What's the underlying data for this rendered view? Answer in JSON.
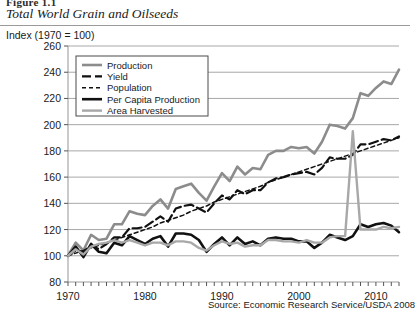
{
  "figure": {
    "label": "Figure 1.1",
    "title": "Total World Grain and Oilseeds",
    "axis_caption": "Index (1970 = 100)",
    "source": "Source: Economic Research Service/USDA 2008"
  },
  "chart_data": {
    "type": "line",
    "title": "Total World Grain and Oilseeds",
    "subtitle": "Index (1970 = 100)",
    "xlabel": "",
    "ylabel": "Index (1970 = 100)",
    "xlim": [
      1970,
      2013
    ],
    "ylim": [
      80,
      260
    ],
    "yticks": [
      80,
      100,
      120,
      140,
      160,
      180,
      200,
      220,
      240,
      260
    ],
    "xticks": [
      1970,
      1980,
      1990,
      2000,
      2010
    ],
    "xtick_labels": [
      "1970",
      "1980",
      "1990",
      "2000",
      "2010"
    ],
    "minor_xtick_interval": 1,
    "grid": "horizontal",
    "legend_position": "upper-left-inside",
    "annotation": "Area Harvested shows a single-year spike near 2007",
    "x": [
      1970,
      1971,
      1972,
      1973,
      1974,
      1975,
      1976,
      1977,
      1978,
      1979,
      1980,
      1981,
      1982,
      1983,
      1984,
      1985,
      1986,
      1987,
      1988,
      1989,
      1990,
      1991,
      1992,
      1993,
      1994,
      1995,
      1996,
      1997,
      1998,
      1999,
      2000,
      2001,
      2002,
      2003,
      2004,
      2005,
      2006,
      2007,
      2008,
      2009,
      2010,
      2011,
      2012,
      2013
    ],
    "series": [
      {
        "name": "Production",
        "style": "solid",
        "color": "#8c8c8c",
        "width": 2.6,
        "values": [
          100,
          110,
          104,
          116,
          112,
          113,
          124,
          124,
          134,
          132,
          131,
          138,
          143,
          136,
          151,
          153,
          155,
          148,
          142,
          153,
          163,
          157,
          168,
          162,
          167,
          166,
          177,
          180,
          180,
          183,
          182,
          183,
          178,
          187,
          200,
          199,
          197,
          205,
          224,
          222,
          228,
          233,
          231,
          242
        ]
      },
      {
        "name": "Yield",
        "style": "dashed",
        "color": "#111111",
        "width": 2.2,
        "values": [
          100,
          104,
          103,
          108,
          105,
          109,
          114,
          114,
          121,
          121,
          122,
          126,
          130,
          126,
          136,
          138,
          139,
          136,
          133,
          140,
          146,
          143,
          150,
          147,
          150,
          150,
          156,
          159,
          160,
          162,
          163,
          164,
          162,
          167,
          175,
          174,
          174,
          177,
          185,
          185,
          187,
          189,
          188,
          191
        ]
      },
      {
        "name": "Population",
        "style": "dotted",
        "color": "#111111",
        "width": 1.5,
        "values": [
          100,
          102,
          104,
          106,
          108,
          110,
          112,
          114,
          116,
          118,
          120,
          122,
          125,
          127,
          129,
          131,
          134,
          136,
          138,
          141,
          143,
          145,
          147,
          149,
          151,
          153,
          156,
          158,
          160,
          162,
          164,
          166,
          168,
          170,
          172,
          174,
          176,
          178,
          180,
          182,
          184,
          186,
          188,
          190
        ]
      },
      {
        "name": "Per Capita Production",
        "style": "solid",
        "color": "#111111",
        "width": 2.6,
        "values": [
          100,
          107,
          99,
          109,
          103,
          102,
          110,
          108,
          115,
          112,
          109,
          113,
          115,
          107,
          117,
          117,
          116,
          112,
          103,
          109,
          114,
          108,
          114,
          109,
          111,
          108,
          113,
          114,
          113,
          113,
          111,
          111,
          106,
          110,
          116,
          114,
          112,
          115,
          124,
          122,
          124,
          125,
          123,
          118
        ]
      },
      {
        "name": "Area Harvested",
        "style": "solid",
        "color": "#a8a8a8",
        "width": 2.4,
        "values": [
          100,
          105,
          101,
          107,
          109,
          110,
          112,
          110,
          112,
          110,
          108,
          110,
          110,
          108,
          111,
          111,
          110,
          106,
          104,
          108,
          111,
          109,
          110,
          107,
          108,
          108,
          112,
          112,
          111,
          111,
          110,
          112,
          110,
          110,
          114,
          115,
          115,
          195,
          120,
          120,
          120,
          122,
          121,
          122
        ]
      }
    ]
  },
  "legend": {
    "items": [
      {
        "label": "Production",
        "swatch": "thick-gray-solid"
      },
      {
        "label": "Yield",
        "swatch": "black-dashed"
      },
      {
        "label": "Population",
        "swatch": "black-dotted"
      },
      {
        "label": "Per Capita Production",
        "swatch": "thick-black-solid"
      },
      {
        "label": "Area Harvested",
        "swatch": "medium-gray-solid"
      }
    ]
  }
}
